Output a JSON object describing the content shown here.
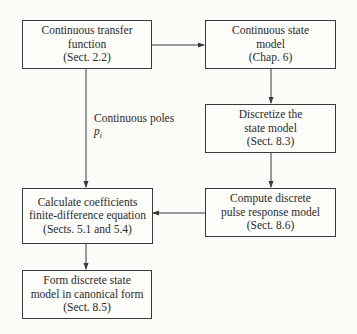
{
  "diagram": {
    "type": "flowchart",
    "nodes": [
      {
        "id": "ctf",
        "lines": [
          "Continuous transfer",
          "function",
          "(Sect. 2.2)"
        ]
      },
      {
        "id": "csm",
        "lines": [
          "Continuous state",
          "model",
          "(Chap. 6)"
        ]
      },
      {
        "id": "dsm",
        "lines": [
          "Discretize the",
          "state model",
          "(Sect. 8.3)"
        ]
      },
      {
        "id": "dprm",
        "lines": [
          "Compute discrete",
          "pulse response model",
          "(Sect. 8.6)"
        ]
      },
      {
        "id": "coef",
        "lines": [
          "Calculate coefficients",
          "finite-difference equation",
          "(Sects. 5.1 and 5.4)"
        ]
      },
      {
        "id": "canon",
        "lines": [
          "Form discrete state",
          "model in canonical form",
          "(Sect. 8.5)"
        ]
      }
    ],
    "edges": [
      {
        "from": "ctf",
        "to": "csm"
      },
      {
        "from": "csm",
        "to": "dsm"
      },
      {
        "from": "dsm",
        "to": "dprm"
      },
      {
        "from": "dprm",
        "to": "coef"
      },
      {
        "from": "ctf",
        "to": "coef",
        "label": "Continuous poles p_i"
      },
      {
        "from": "coef",
        "to": "canon"
      }
    ],
    "edge_label": {
      "text": "Continuous poles",
      "symbol": "p",
      "subscript": "i"
    },
    "colors": {
      "line": "#3a3a3a",
      "background": "#fbfbf7"
    }
  }
}
